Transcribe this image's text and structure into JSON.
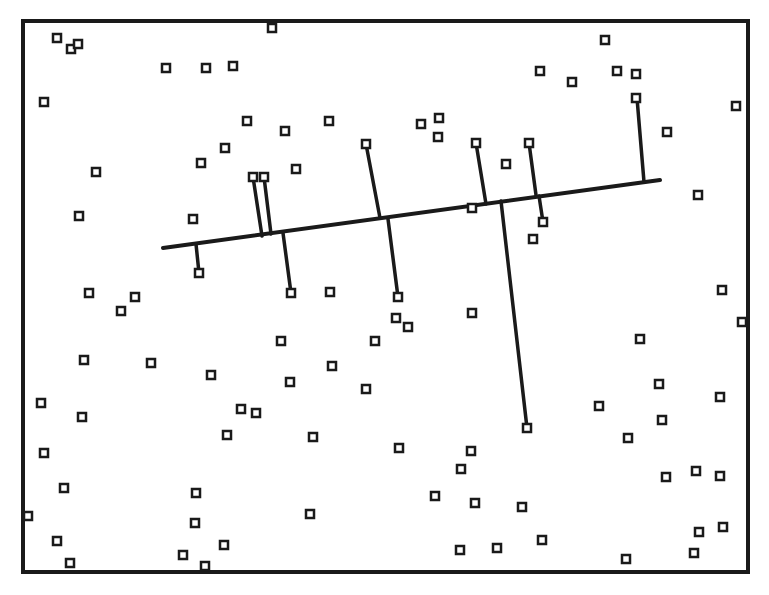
{
  "diagram": {
    "type": "point-query-diagram",
    "stroke_color": "#1a1a1a",
    "background": "#ffffff",
    "frame": {
      "x1": 23,
      "y1": 21,
      "x2": 748,
      "y2": 572,
      "stroke_width": 4
    },
    "query_line": {
      "x1": 163,
      "y1": 248,
      "x2": 660,
      "y2": 180,
      "stroke_width": 4
    },
    "marker": {
      "shape": "hollow-square",
      "size": 8,
      "stroke_width": 2.5
    },
    "points": [
      [
        57,
        38
      ],
      [
        71,
        49
      ],
      [
        78,
        44
      ],
      [
        44,
        102
      ],
      [
        166,
        68
      ],
      [
        206,
        68
      ],
      [
        233,
        66
      ],
      [
        272,
        28
      ],
      [
        96,
        172
      ],
      [
        79,
        216
      ],
      [
        225,
        148
      ],
      [
        201,
        163
      ],
      [
        247,
        121
      ],
      [
        285,
        131
      ],
      [
        329,
        121
      ],
      [
        296,
        169
      ],
      [
        193,
        219
      ],
      [
        421,
        124
      ],
      [
        439,
        118
      ],
      [
        438,
        137
      ],
      [
        476,
        143
      ],
      [
        506,
        164
      ],
      [
        529,
        143
      ],
      [
        543,
        222
      ],
      [
        533,
        239
      ],
      [
        472,
        208
      ],
      [
        605,
        40
      ],
      [
        540,
        71
      ],
      [
        572,
        82
      ],
      [
        617,
        71
      ],
      [
        636,
        74
      ],
      [
        636,
        98
      ],
      [
        667,
        132
      ],
      [
        736,
        106
      ],
      [
        698,
        195
      ],
      [
        722,
        290
      ],
      [
        742,
        322
      ],
      [
        640,
        339
      ],
      [
        659,
        384
      ],
      [
        720,
        397
      ],
      [
        662,
        420
      ],
      [
        628,
        438
      ],
      [
        599,
        406
      ],
      [
        666,
        477
      ],
      [
        696,
        471
      ],
      [
        720,
        476
      ],
      [
        699,
        532
      ],
      [
        723,
        527
      ],
      [
        694,
        553
      ],
      [
        626,
        559
      ],
      [
        199,
        273
      ],
      [
        253,
        177
      ],
      [
        264,
        177
      ],
      [
        291,
        293
      ],
      [
        366,
        144
      ],
      [
        398,
        297
      ],
      [
        396,
        318
      ],
      [
        408,
        327
      ],
      [
        330,
        292
      ],
      [
        89,
        293
      ],
      [
        135,
        297
      ],
      [
        121,
        311
      ],
      [
        472,
        313
      ],
      [
        375,
        341
      ],
      [
        281,
        341
      ],
      [
        84,
        360
      ],
      [
        151,
        363
      ],
      [
        211,
        375
      ],
      [
        290,
        382
      ],
      [
        332,
        366
      ],
      [
        366,
        389
      ],
      [
        41,
        403
      ],
      [
        82,
        417
      ],
      [
        241,
        409
      ],
      [
        256,
        413
      ],
      [
        227,
        435
      ],
      [
        313,
        437
      ],
      [
        399,
        448
      ],
      [
        471,
        451
      ],
      [
        461,
        469
      ],
      [
        527,
        428
      ],
      [
        44,
        453
      ],
      [
        64,
        488
      ],
      [
        196,
        493
      ],
      [
        195,
        523
      ],
      [
        310,
        514
      ],
      [
        435,
        496
      ],
      [
        475,
        503
      ],
      [
        522,
        507
      ],
      [
        28,
        516
      ],
      [
        57,
        541
      ],
      [
        70,
        563
      ],
      [
        183,
        555
      ],
      [
        205,
        566
      ],
      [
        224,
        545
      ],
      [
        460,
        550
      ],
      [
        497,
        548
      ],
      [
        542,
        540
      ]
    ],
    "projections": [
      {
        "from": [
          199,
          273
        ],
        "to": [
          196,
          244
        ]
      },
      {
        "from": [
          253,
          177
        ],
        "to": [
          262,
          236
        ]
      },
      {
        "from": [
          264,
          177
        ],
        "to": [
          271,
          234
        ]
      },
      {
        "from": [
          291,
          293
        ],
        "to": [
          283,
          233
        ]
      },
      {
        "from": [
          366,
          144
        ],
        "to": [
          380,
          218
        ]
      },
      {
        "from": [
          398,
          297
        ],
        "to": [
          388,
          219
        ]
      },
      {
        "from": [
          476,
          143
        ],
        "to": [
          486,
          204
        ]
      },
      {
        "from": [
          529,
          143
        ],
        "to": [
          536,
          195
        ]
      },
      {
        "from": [
          543,
          222
        ],
        "to": [
          539,
          196
        ]
      },
      {
        "from": [
          527,
          428
        ],
        "to": [
          501,
          201
        ]
      },
      {
        "from": [
          637,
          98
        ],
        "to": [
          644,
          182
        ]
      }
    ]
  }
}
